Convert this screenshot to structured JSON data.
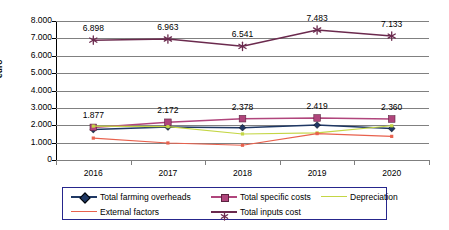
{
  "chart_data": {
    "type": "line",
    "title": "",
    "xlabel": "",
    "ylabel": "euro",
    "categories": [
      "2016",
      "2017",
      "2018",
      "2019",
      "2020"
    ],
    "ylim": [
      0,
      8000
    ],
    "ytick_labels": [
      "8.000",
      "7.000",
      "6.000",
      "5.000",
      "4.000",
      "3.000",
      "2.000",
      "1.000",
      "0"
    ],
    "ytick_values": [
      8000,
      7000,
      6000,
      5000,
      4000,
      3000,
      2000,
      1000,
      0
    ],
    "grid": "horizontal",
    "legend_position": "bottom",
    "number_format": "european-thousands-dot",
    "series": [
      {
        "name": "Total farming overheads",
        "color": "#1f3864",
        "marker": "diamond",
        "values": [
          1750,
          1900,
          1860,
          2010,
          1810
        ],
        "labels_shown": false
      },
      {
        "name": "Total specific costs",
        "color": "#b0457c",
        "marker": "square",
        "values": [
          1877,
          2172,
          2378,
          2419,
          2360
        ],
        "labels_shown": true,
        "labels": [
          "1.877",
          "2.172",
          "2.378",
          "2.419",
          "2.360"
        ]
      },
      {
        "name": "Depreciation",
        "color": "#c4d645",
        "marker": "none",
        "values": [
          1950,
          1920,
          1500,
          1560,
          1970
        ],
        "labels_shown": false
      },
      {
        "name": "External factors",
        "color": "#e8614d",
        "marker": "none",
        "values": [
          1260,
          980,
          850,
          1520,
          1360
        ],
        "labels_shown": false
      },
      {
        "name": "Total inputs cost",
        "color": "#6b2a4e",
        "marker": "star",
        "values": [
          6898,
          6963,
          6541,
          7483,
          7133
        ],
        "labels_shown": true,
        "labels": [
          "6.898",
          "6.963",
          "6.541",
          "7.483",
          "7.133"
        ]
      }
    ]
  },
  "legend": {
    "items": [
      {
        "label": "Total farming overheads"
      },
      {
        "label": "Total specific costs"
      },
      {
        "label": "Depreciation"
      },
      {
        "label": "External factors"
      },
      {
        "label": "Total inputs cost"
      }
    ]
  }
}
